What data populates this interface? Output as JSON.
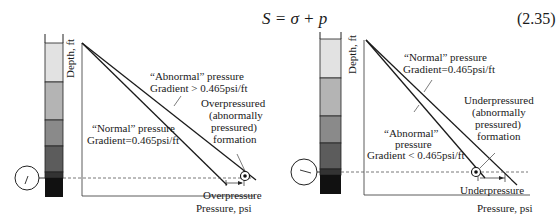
{
  "equation": {
    "text": "S = σ + p",
    "number": "(2.35)"
  },
  "left_panel": {
    "y_axis_label": "Depth, ft",
    "x_axis_label": "Pressure, psi",
    "abnormal_label_line1": "“Abnormal” pressure",
    "abnormal_label_line2": "Gradient > 0.465psi/ft",
    "normal_label_line1": "“Normal” pressure",
    "normal_label_line2": "Gradient=0.465psi/ft",
    "formation_label": [
      "Overpressured",
      "(abnormally",
      "pressured)",
      "formation"
    ],
    "delta_label": "Overpressure"
  },
  "right_panel": {
    "y_axis_label": "Depth, ft",
    "x_axis_label": "Pressure, psi",
    "normal_label_line1": "“Normal” pressure",
    "normal_label_line2": "Gradient=0.465psi/ft",
    "abnormal_label_line1": "“Abnormal”",
    "abnormal_label_line2": "pressure",
    "abnormal_label_line3": "Gradient < 0.465psi/ft",
    "formation_label": [
      "Underpressured",
      "(abnormally",
      "pressured)",
      "formation"
    ],
    "delta_label": "Underpressure"
  },
  "colors": {
    "stripe_1": "#ffffff",
    "stripe_2": "#e2e2e2",
    "stripe_3": "#b4b4b4",
    "stripe_4": "#8a8a8a",
    "stripe_5": "#5c5c5c",
    "stripe_6": "#333333",
    "stripe_7": "#111111",
    "line": "#1a1a1a"
  }
}
